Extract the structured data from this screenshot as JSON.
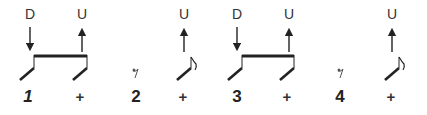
{
  "pattern": {
    "beats": [
      {
        "count": "1",
        "stroke": "D",
        "x": 30
      },
      {
        "count": "+",
        "stroke": "U",
        "x": 82
      },
      {
        "count": "2",
        "stroke": "",
        "x": 136
      },
      {
        "count": "+",
        "stroke": "U",
        "x": 184
      },
      {
        "count": "3",
        "stroke": "D",
        "x": 237
      },
      {
        "count": "+",
        "stroke": "U",
        "x": 289
      },
      {
        "count": "4",
        "stroke": "",
        "x": 341
      },
      {
        "count": "+",
        "stroke": "U",
        "x": 392
      }
    ],
    "colors": {
      "ink": "#222222",
      "text": "#333333"
    }
  }
}
